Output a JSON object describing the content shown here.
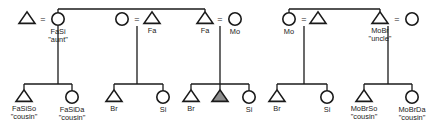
{
  "diagram": {
    "kind": "kinship-chart",
    "title": "",
    "colors": {
      "stroke": "#1a1a1a",
      "background": "#ffffff",
      "ego_fill": "#8e8e8e"
    },
    "marriage_symbol": "=",
    "generation1": {
      "label": "parents-generation",
      "nodes": [
        {
          "id": "g1n1",
          "shape": "triangle",
          "sex": "male",
          "label": "",
          "quote": "",
          "x": 27,
          "y": 19
        },
        {
          "id": "g1n2",
          "shape": "circle",
          "sex": "female",
          "label": "FaSi",
          "quote": "\"aunt\"",
          "x": 58,
          "y": 19
        },
        {
          "id": "g1n3",
          "shape": "circle",
          "sex": "female",
          "label": "",
          "quote": "",
          "x": 122,
          "y": 19
        },
        {
          "id": "g1n4",
          "shape": "triangle",
          "sex": "male",
          "label": "Fa",
          "quote": "",
          "x": 152,
          "y": 19
        },
        {
          "id": "g1n5",
          "shape": "triangle",
          "sex": "male",
          "label": "Fa",
          "quote": "",
          "x": 205,
          "y": 19
        },
        {
          "id": "g1n6",
          "shape": "circle",
          "sex": "female",
          "label": "Mo",
          "quote": "",
          "x": 235,
          "y": 19
        },
        {
          "id": "g1n7",
          "shape": "circle",
          "sex": "female",
          "label": "Mo",
          "quote": "",
          "x": 289,
          "y": 19
        },
        {
          "id": "g1n8",
          "shape": "triangle",
          "sex": "male",
          "label": "",
          "quote": "",
          "x": 318,
          "y": 19
        },
        {
          "id": "g1n9",
          "shape": "triangle",
          "sex": "male",
          "label": "MoBr",
          "quote": "\"uncle\"",
          "x": 380,
          "y": 19
        },
        {
          "id": "g1n10",
          "shape": "circle",
          "sex": "female",
          "label": "",
          "quote": "",
          "x": 412,
          "y": 19
        }
      ],
      "marriages": [
        {
          "id": "m1",
          "left": "g1n1",
          "right": "g1n2",
          "symbol": "=",
          "x": 43,
          "y": 19
        },
        {
          "id": "m2",
          "left": "g1n3",
          "right": "g1n4",
          "symbol": "=",
          "x": 137,
          "y": 19
        },
        {
          "id": "m3",
          "left": "g1n5",
          "right": "g1n6",
          "symbol": "=",
          "x": 220,
          "y": 19
        },
        {
          "id": "m4",
          "left": "g1n7",
          "right": "g1n8",
          "symbol": "=",
          "x": 304,
          "y": 19
        },
        {
          "id": "m5",
          "left": "g1n9",
          "right": "g1n10",
          "symbol": "=",
          "x": 397,
          "y": 19
        }
      ],
      "sibling_bars": [
        {
          "id": "sb1",
          "members": [
            "g1n2",
            "g1n5"
          ],
          "x1": 58,
          "x2": 205,
          "y": 9
        },
        {
          "id": "sb2",
          "members": [
            "g1n7",
            "g1n9"
          ],
          "x1": 289,
          "x2": 380,
          "y": 9
        }
      ]
    },
    "generation2": {
      "label": "ego-generation",
      "nodes": [
        {
          "id": "g2n1",
          "shape": "triangle",
          "sex": "male",
          "ego": false,
          "label": "FaSiSo",
          "quote": "\"cousin\"",
          "x": 24,
          "y": 97
        },
        {
          "id": "g2n2",
          "shape": "circle",
          "sex": "female",
          "ego": false,
          "label": "FaSiDa",
          "quote": "\"cousin\"",
          "x": 72,
          "y": 97
        },
        {
          "id": "g2n3",
          "shape": "triangle",
          "sex": "male",
          "ego": false,
          "label": "Br",
          "quote": "",
          "x": 114,
          "y": 97
        },
        {
          "id": "g2n4",
          "shape": "circle",
          "sex": "female",
          "ego": false,
          "label": "Si",
          "quote": "",
          "x": 163,
          "y": 97
        },
        {
          "id": "g2n5",
          "shape": "triangle",
          "sex": "male",
          "ego": false,
          "label": "Br",
          "quote": "",
          "x": 191,
          "y": 97
        },
        {
          "id": "g2n6",
          "shape": "triangle",
          "sex": "male",
          "ego": true,
          "label": "",
          "quote": "",
          "x": 220,
          "y": 97
        },
        {
          "id": "g2n7",
          "shape": "circle",
          "sex": "female",
          "ego": false,
          "label": "Si",
          "quote": "",
          "x": 249,
          "y": 97
        },
        {
          "id": "g2n8",
          "shape": "triangle",
          "sex": "male",
          "ego": false,
          "label": "Br",
          "quote": "",
          "x": 277,
          "y": 97
        },
        {
          "id": "g2n9",
          "shape": "circle",
          "sex": "female",
          "ego": false,
          "label": "Si",
          "quote": "",
          "x": 327,
          "y": 97
        },
        {
          "id": "g2n10",
          "shape": "triangle",
          "sex": "male",
          "ego": false,
          "label": "MoBrSo",
          "quote": "\"cousin\"",
          "x": 364,
          "y": 97
        },
        {
          "id": "g2n11",
          "shape": "circle",
          "sex": "female",
          "ego": false,
          "label": "MoBrDa",
          "quote": "\"cousin\"",
          "x": 412,
          "y": 97
        }
      ],
      "sibling_groups": [
        {
          "id": "sg1",
          "parent_marriage": "m1",
          "children": [
            "g2n1",
            "g2n2"
          ],
          "descent_x": 58,
          "bar_x1": 24,
          "bar_x2": 72,
          "bar_y": 84
        },
        {
          "id": "sg2",
          "parent_marriage": "m2",
          "children": [
            "g2n3",
            "g2n4"
          ],
          "descent_x": 137,
          "bar_x1": 114,
          "bar_x2": 163,
          "bar_y": 84
        },
        {
          "id": "sg3",
          "parent_marriage": "m3",
          "children": [
            "g2n5",
            "g2n6",
            "g2n7"
          ],
          "descent_x": 220,
          "bar_x1": 191,
          "bar_x2": 249,
          "bar_y": 84
        },
        {
          "id": "sg4",
          "parent_marriage": "m4",
          "children": [
            "g2n8",
            "g2n9"
          ],
          "descent_x": 304,
          "bar_x1": 277,
          "bar_x2": 327,
          "bar_y": 84
        },
        {
          "id": "sg5",
          "parent_marriage": "m5",
          "children": [
            "g2n10",
            "g2n11"
          ],
          "descent_x": 388,
          "bar_x1": 364,
          "bar_x2": 412,
          "bar_y": 84
        }
      ]
    },
    "legend": {
      "triangle_means": "male",
      "circle_means": "female",
      "filled_means": "ego",
      "equals_means": "marriage"
    }
  }
}
